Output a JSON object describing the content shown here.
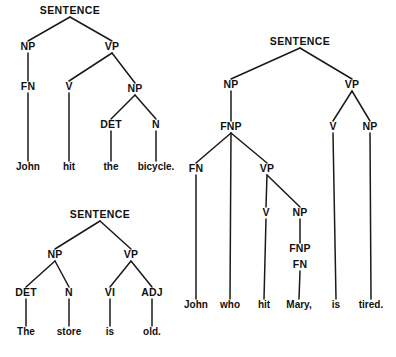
{
  "figure": {
    "background_color": "#ffffff",
    "ink_color": "#111111",
    "edge_color": "#1a1a1a"
  },
  "trees": [
    {
      "id": "tree-sentence-john-hit-the-bicycle",
      "sentence": "John hit the bicycle.",
      "root": "SENTENCE",
      "nodes": [
        {
          "id": "t1-s",
          "label": "SENTENCE",
          "x": 70,
          "y": 14,
          "kind": "root"
        },
        {
          "id": "t1-np",
          "label": "NP",
          "x": 28,
          "y": 50,
          "kind": "phrase"
        },
        {
          "id": "t1-vp",
          "label": "VP",
          "x": 112,
          "y": 50,
          "kind": "phrase"
        },
        {
          "id": "t1-fn",
          "label": "FN",
          "x": 28,
          "y": 90,
          "kind": "phrase"
        },
        {
          "id": "t1-v",
          "label": "V",
          "x": 69,
          "y": 90,
          "kind": "phrase"
        },
        {
          "id": "t1-np2",
          "label": "NP",
          "x": 135,
          "y": 92,
          "kind": "phrase"
        },
        {
          "id": "t1-det",
          "label": "DET",
          "x": 111,
          "y": 128,
          "kind": "phrase"
        },
        {
          "id": "t1-n",
          "label": "N",
          "x": 156,
          "y": 128,
          "kind": "phrase"
        }
      ],
      "leaves": [
        {
          "id": "t1-w1",
          "label": "John",
          "x": 28,
          "y": 170,
          "parent": "t1-fn"
        },
        {
          "id": "t1-w2",
          "label": "hit",
          "x": 69,
          "y": 170,
          "parent": "t1-v"
        },
        {
          "id": "t1-w3",
          "label": "the",
          "x": 111,
          "y": 170,
          "parent": "t1-det"
        },
        {
          "id": "t1-w4",
          "label": "bicycle.",
          "x": 156,
          "y": 170,
          "parent": "t1-n"
        }
      ],
      "edges": [
        [
          "t1-s",
          "t1-np"
        ],
        [
          "t1-s",
          "t1-vp"
        ],
        [
          "t1-np",
          "t1-fn"
        ],
        [
          "t1-vp",
          "t1-v"
        ],
        [
          "t1-vp",
          "t1-np2"
        ],
        [
          "t1-np2",
          "t1-det"
        ],
        [
          "t1-np2",
          "t1-n"
        ],
        [
          "t1-fn",
          "t1-w1"
        ],
        [
          "t1-v",
          "t1-w2"
        ],
        [
          "t1-det",
          "t1-w3"
        ],
        [
          "t1-n",
          "t1-w4"
        ]
      ]
    },
    {
      "id": "tree-sentence-the-store-is-old",
      "sentence": "The store is old.",
      "root": "SENTENCE",
      "nodes": [
        {
          "id": "t2-s",
          "label": "SENTENCE",
          "x": 100,
          "y": 218,
          "kind": "root"
        },
        {
          "id": "t2-np",
          "label": "NP",
          "x": 55,
          "y": 258,
          "kind": "phrase"
        },
        {
          "id": "t2-vp",
          "label": "VP",
          "x": 131,
          "y": 258,
          "kind": "phrase"
        },
        {
          "id": "t2-det",
          "label": "DET",
          "x": 26,
          "y": 296,
          "kind": "phrase"
        },
        {
          "id": "t2-n",
          "label": "N",
          "x": 69,
          "y": 296,
          "kind": "phrase"
        },
        {
          "id": "t2-vi",
          "label": "VI",
          "x": 110,
          "y": 296,
          "kind": "phrase"
        },
        {
          "id": "t2-adj",
          "label": "ADJ",
          "x": 152,
          "y": 296,
          "kind": "phrase"
        }
      ],
      "leaves": [
        {
          "id": "t2-w1",
          "label": "The",
          "x": 26,
          "y": 335,
          "parent": "t2-det"
        },
        {
          "id": "t2-w2",
          "label": "store",
          "x": 69,
          "y": 335,
          "parent": "t2-n"
        },
        {
          "id": "t2-w3",
          "label": "is",
          "x": 110,
          "y": 335,
          "parent": "t2-vi"
        },
        {
          "id": "t2-w4",
          "label": "old.",
          "x": 152,
          "y": 335,
          "parent": "t2-adj"
        }
      ],
      "edges": [
        [
          "t2-s",
          "t2-np"
        ],
        [
          "t2-s",
          "t2-vp"
        ],
        [
          "t2-np",
          "t2-det"
        ],
        [
          "t2-np",
          "t2-n"
        ],
        [
          "t2-vp",
          "t2-vi"
        ],
        [
          "t2-vp",
          "t2-adj"
        ],
        [
          "t2-det",
          "t2-w1"
        ],
        [
          "t2-n",
          "t2-w2"
        ],
        [
          "t2-vi",
          "t2-w3"
        ],
        [
          "t2-adj",
          "t2-w4"
        ]
      ]
    },
    {
      "id": "tree-sentence-john-who-hit-mary-is-tired",
      "sentence": "John who hit Mary, is tired.",
      "root": "SENTENCE",
      "nodes": [
        {
          "id": "t3-s",
          "label": "SENTENCE",
          "x": 300,
          "y": 45,
          "kind": "root"
        },
        {
          "id": "t3-np",
          "label": "NP",
          "x": 231,
          "y": 88,
          "kind": "phrase"
        },
        {
          "id": "t3-vp",
          "label": "VP",
          "x": 352,
          "y": 88,
          "kind": "phrase"
        },
        {
          "id": "t3-fnp",
          "label": "FNP",
          "x": 231,
          "y": 130,
          "kind": "phrase"
        },
        {
          "id": "t3-v1",
          "label": "V",
          "x": 333,
          "y": 130,
          "kind": "phrase"
        },
        {
          "id": "t3-np2",
          "label": "NP",
          "x": 370,
          "y": 130,
          "kind": "phrase"
        },
        {
          "id": "t3-fn",
          "label": "FN",
          "x": 196,
          "y": 172,
          "kind": "phrase"
        },
        {
          "id": "t3-vp2",
          "label": "VP",
          "x": 267,
          "y": 172,
          "kind": "phrase"
        },
        {
          "id": "t3-v2",
          "label": "V",
          "x": 266,
          "y": 216,
          "kind": "phrase"
        },
        {
          "id": "t3-np3",
          "label": "NP",
          "x": 300,
          "y": 216,
          "kind": "phrase"
        },
        {
          "id": "t3-fnp2",
          "label": "FNP",
          "x": 300,
          "y": 252,
          "kind": "phrase"
        },
        {
          "id": "t3-fn2",
          "label": "FN",
          "x": 300,
          "y": 268,
          "kind": "phrase"
        }
      ],
      "leaves": [
        {
          "id": "t3-w1",
          "label": "John",
          "x": 196,
          "y": 308,
          "parent": "t3-fn"
        },
        {
          "id": "t3-w2",
          "label": "who",
          "x": 230,
          "y": 308,
          "parent": "t3-fnp"
        },
        {
          "id": "t3-w3",
          "label": "hit",
          "x": 264,
          "y": 308,
          "parent": "t3-v2"
        },
        {
          "id": "t3-w4",
          "label": "Mary,",
          "x": 299,
          "y": 308,
          "parent": "t3-fn2"
        },
        {
          "id": "t3-w5",
          "label": "is",
          "x": 336,
          "y": 308,
          "parent": "t3-v1"
        },
        {
          "id": "t3-w6",
          "label": "tired.",
          "x": 371,
          "y": 308,
          "parent": "t3-np2"
        }
      ],
      "edges": [
        [
          "t3-s",
          "t3-np"
        ],
        [
          "t3-s",
          "t3-vp"
        ],
        [
          "t3-np",
          "t3-fnp"
        ],
        [
          "t3-vp",
          "t3-v1"
        ],
        [
          "t3-vp",
          "t3-np2"
        ],
        [
          "t3-fnp",
          "t3-fn"
        ],
        [
          "t3-fnp",
          "t3-w2"
        ],
        [
          "t3-fnp",
          "t3-vp2"
        ],
        [
          "t3-vp2",
          "t3-v2"
        ],
        [
          "t3-vp2",
          "t3-np3"
        ],
        [
          "t3-np3",
          "t3-fnp2"
        ],
        [
          "t3-fn2",
          "t3-w4"
        ],
        [
          "t3-fn",
          "t3-w1"
        ],
        [
          "t3-v2",
          "t3-w3"
        ],
        [
          "t3-v1",
          "t3-w5"
        ],
        [
          "t3-np2",
          "t3-w6"
        ]
      ]
    }
  ]
}
